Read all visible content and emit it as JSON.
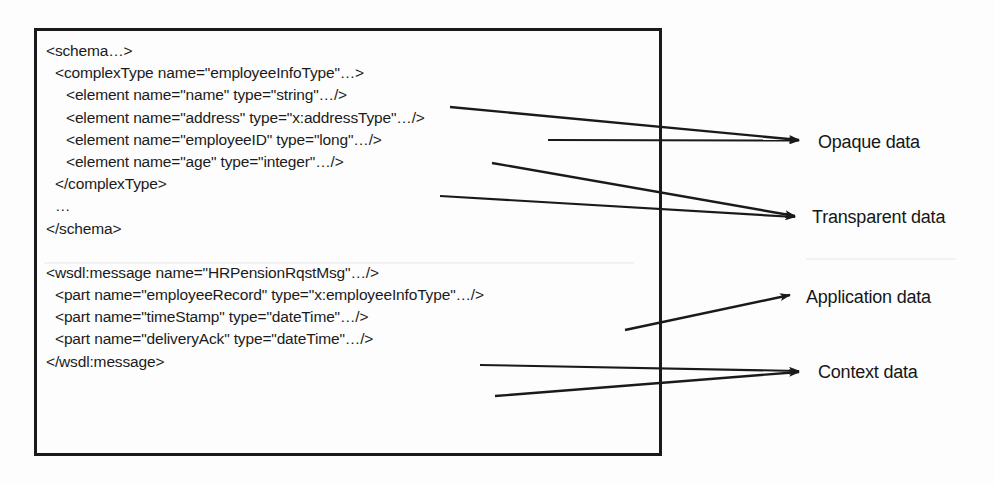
{
  "diagram": {
    "box": {
      "border_color": "#1a1a1a",
      "code_lines": [
        {
          "indent": 0,
          "text": "<schema…>"
        },
        {
          "indent": 1,
          "text": "<complexType name=\"employeeInfoType\"…>"
        },
        {
          "indent": 2,
          "text": "<element name=\"name\" type=\"string\"…/>"
        },
        {
          "indent": 2,
          "text": "<element name=\"address\" type=\"x:addressType\"…/>"
        },
        {
          "indent": 2,
          "text": "<element name=\"employeeID\" type=\"long\"…/>"
        },
        {
          "indent": 2,
          "text": "<element name=\"age\" type=\"integer\"…/>"
        },
        {
          "indent": 1,
          "text": "</complexType>"
        },
        {
          "indent": 1,
          "text": "…"
        },
        {
          "indent": 0,
          "text": "</schema>"
        },
        {
          "indent": 0,
          "text": ""
        },
        {
          "indent": 0,
          "text": "<wsdl:message name=\"HRPensionRqstMsg\"…/>"
        },
        {
          "indent": 1,
          "text": "<part name=\"employeeRecord\" type=\"x:employeeInfoType\"…/>"
        },
        {
          "indent": 1,
          "text": "<part name=\"timeStamp\" type=\"dateTime\"…/>"
        },
        {
          "indent": 1,
          "text": "<part name=\"deliveryAck\" type=\"dateTime\"…/>"
        },
        {
          "indent": 0,
          "text": "</wsdl:message>"
        }
      ]
    },
    "callouts": [
      {
        "id": "opaque",
        "label": "Opaque data"
      },
      {
        "id": "transparent",
        "label": "Transparent data"
      },
      {
        "id": "application",
        "label": "Application data"
      },
      {
        "id": "context",
        "label": "Context data"
      }
    ],
    "colors": {
      "ink": "#1b1b1b",
      "arrow": "#1a1a1a",
      "page": "#fdfdfd"
    }
  }
}
